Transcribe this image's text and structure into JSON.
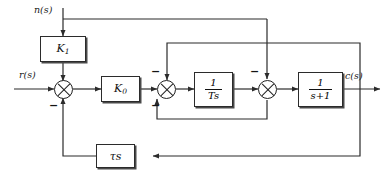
{
  "diagram": {
    "signals": {
      "disturbance": "n(s)",
      "reference": "r(s)",
      "output": "c(s)"
    },
    "blocks": [
      {
        "id": "k1",
        "label": "K",
        "subscript": "1",
        "kind": "gain"
      },
      {
        "id": "k0",
        "label": "K",
        "subscript": "0",
        "kind": "gain"
      },
      {
        "id": "integ",
        "numerator": "1",
        "denominator": "Ts",
        "kind": "fraction"
      },
      {
        "id": "lag",
        "numerator": "1",
        "denominator": "s+1",
        "kind": "fraction"
      },
      {
        "id": "rate",
        "label": "τs",
        "kind": "gain"
      }
    ],
    "summing_junctions": [
      {
        "id": "sum1",
        "signs": {
          "bottom": "−"
        }
      },
      {
        "id": "sum2",
        "signs": {
          "top": "−",
          "bottom": "−"
        }
      },
      {
        "id": "sum3",
        "signs": {
          "top": "−"
        }
      }
    ],
    "colors": {
      "line": "#2b2b2b",
      "block_border": "#2b2b2b",
      "shadow": "#4a4a4a",
      "background": "#ffffff",
      "text": "#111111"
    }
  }
}
